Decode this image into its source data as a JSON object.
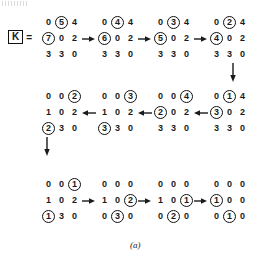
{
  "figure": {
    "caption": "(a)",
    "label": {
      "symbol": "K",
      "equals": "="
    },
    "colors": {
      "ink": "#1a1a1a",
      "background": "#ffffff"
    }
  },
  "matrices": [
    {
      "id": "m1",
      "rows": [
        [
          "0",
          "5",
          "4"
        ],
        [
          "7",
          "0",
          "2"
        ],
        [
          "3",
          "3",
          "0"
        ]
      ],
      "circled": [
        [
          false,
          true,
          false
        ],
        [
          true,
          false,
          false
        ],
        [
          false,
          false,
          false
        ]
      ]
    },
    {
      "id": "m2",
      "rows": [
        [
          "0",
          "4",
          "4"
        ],
        [
          "6",
          "0",
          "2"
        ],
        [
          "3",
          "3",
          "0"
        ]
      ],
      "circled": [
        [
          false,
          true,
          false
        ],
        [
          true,
          false,
          false
        ],
        [
          false,
          false,
          false
        ]
      ]
    },
    {
      "id": "m3",
      "rows": [
        [
          "0",
          "3",
          "4"
        ],
        [
          "5",
          "0",
          "2"
        ],
        [
          "3",
          "3",
          "0"
        ]
      ],
      "circled": [
        [
          false,
          true,
          false
        ],
        [
          true,
          false,
          false
        ],
        [
          false,
          false,
          false
        ]
      ]
    },
    {
      "id": "m4",
      "rows": [
        [
          "0",
          "2",
          "4"
        ],
        [
          "4",
          "0",
          "2"
        ],
        [
          "3",
          "3",
          "0"
        ]
      ],
      "circled": [
        [
          false,
          true,
          false
        ],
        [
          true,
          false,
          false
        ],
        [
          false,
          false,
          false
        ]
      ]
    },
    {
      "id": "m5",
      "rows": [
        [
          "0",
          "1",
          "4"
        ],
        [
          "3",
          "0",
          "2"
        ],
        [
          "3",
          "3",
          "0"
        ]
      ],
      "circled": [
        [
          false,
          true,
          false
        ],
        [
          true,
          false,
          false
        ],
        [
          false,
          false,
          false
        ]
      ]
    },
    {
      "id": "m6",
      "rows": [
        [
          "0",
          "0",
          "4"
        ],
        [
          "2",
          "0",
          "2"
        ],
        [
          "3",
          "3",
          "0"
        ]
      ],
      "circled": [
        [
          false,
          false,
          true
        ],
        [
          true,
          false,
          false
        ],
        [
          false,
          false,
          false
        ]
      ]
    },
    {
      "id": "m7",
      "rows": [
        [
          "0",
          "0",
          "3"
        ],
        [
          "1",
          "0",
          "2"
        ],
        [
          "3",
          "3",
          "0"
        ]
      ],
      "circled": [
        [
          false,
          false,
          true
        ],
        [
          false,
          false,
          false
        ],
        [
          true,
          false,
          false
        ]
      ]
    },
    {
      "id": "m8",
      "rows": [
        [
          "0",
          "0",
          "2"
        ],
        [
          "1",
          "0",
          "2"
        ],
        [
          "2",
          "3",
          "0"
        ]
      ],
      "circled": [
        [
          false,
          false,
          true
        ],
        [
          false,
          false,
          false
        ],
        [
          true,
          false,
          false
        ]
      ]
    },
    {
      "id": "m9",
      "rows": [
        [
          "0",
          "0",
          "1"
        ],
        [
          "1",
          "0",
          "2"
        ],
        [
          "1",
          "3",
          "0"
        ]
      ],
      "circled": [
        [
          false,
          false,
          true
        ],
        [
          false,
          false,
          false
        ],
        [
          true,
          false,
          false
        ]
      ]
    },
    {
      "id": "m10",
      "rows": [
        [
          "0",
          "0",
          "0"
        ],
        [
          "1",
          "0",
          "2"
        ],
        [
          "0",
          "3",
          "0"
        ]
      ],
      "circled": [
        [
          false,
          false,
          false
        ],
        [
          false,
          false,
          true
        ],
        [
          false,
          true,
          false
        ]
      ]
    },
    {
      "id": "m11",
      "rows": [
        [
          "0",
          "0",
          "0"
        ],
        [
          "1",
          "0",
          "1"
        ],
        [
          "0",
          "2",
          "0"
        ]
      ],
      "circled": [
        [
          false,
          false,
          false
        ],
        [
          false,
          false,
          true
        ],
        [
          false,
          true,
          false
        ]
      ]
    },
    {
      "id": "m12",
      "rows": [
        [
          "0",
          "0",
          "0"
        ],
        [
          "1",
          "0",
          "0"
        ],
        [
          "0",
          "1",
          "0"
        ]
      ],
      "circled": [
        [
          false,
          false,
          false
        ],
        [
          true,
          false,
          false
        ],
        [
          false,
          true,
          false
        ]
      ]
    }
  ],
  "arrows": [
    {
      "id": "a1",
      "direction": "right"
    },
    {
      "id": "a2",
      "direction": "right"
    },
    {
      "id": "a3",
      "direction": "right"
    },
    {
      "id": "a4",
      "direction": "down"
    },
    {
      "id": "a5",
      "direction": "left"
    },
    {
      "id": "a6",
      "direction": "left"
    },
    {
      "id": "a7",
      "direction": "left"
    },
    {
      "id": "a8",
      "direction": "down"
    },
    {
      "id": "a9",
      "direction": "right"
    },
    {
      "id": "a10",
      "direction": "right"
    },
    {
      "id": "a11",
      "direction": "right"
    }
  ]
}
